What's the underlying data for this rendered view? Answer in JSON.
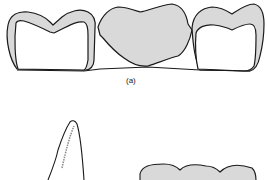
{
  "figure": {
    "panels": [
      {
        "id": "a",
        "label": "(a)",
        "description": "Three-unit bridge: two abutment crowns with metal copings and central pontic"
      },
      {
        "id": "b",
        "description": "Side profile of a tooth crown and partial view of a bridge (cropped)"
      }
    ],
    "colors": {
      "outline": "#1a1a1a",
      "metal_fill": "#d9d9d9",
      "background": "#ffffff"
    }
  }
}
